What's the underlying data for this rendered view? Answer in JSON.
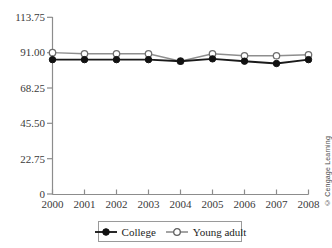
{
  "chart_data": {
    "type": "line",
    "title": "",
    "subtitle": "",
    "xlabel": "",
    "ylabel": "",
    "categories": [
      "2000",
      "2001",
      "2002",
      "2003",
      "2004",
      "2005",
      "2006",
      "2007",
      "2008"
    ],
    "x": [
      2000,
      2001,
      2002,
      2003,
      2004,
      2005,
      2006,
      2007,
      2008
    ],
    "series": [
      {
        "name": "College",
        "marker": "filled-circle",
        "color": "#111111",
        "values": [
          86.5,
          86.5,
          86.5,
          86.5,
          85.5,
          87.0,
          85.5,
          84.0,
          86.5
        ]
      },
      {
        "name": "Young adult",
        "marker": "open-circle",
        "color": "#6f6f6f",
        "values": [
          91.0,
          90.3,
          90.3,
          90.3,
          85.5,
          90.3,
          89.0,
          89.0,
          89.6
        ]
      }
    ],
    "ylim": [
      0,
      113.75
    ],
    "yticks": [
      0,
      22.75,
      45.5,
      68.25,
      91.0,
      113.75
    ],
    "ytick_labels": [
      "0",
      "22.75",
      "45.50",
      "68.25",
      "91.00",
      "113.75"
    ],
    "xlim": [
      2000,
      2008
    ],
    "grid": false,
    "legend_position": "bottom-center"
  },
  "legend": {
    "entries": [
      {
        "label": "College",
        "marker": "filled-circle"
      },
      {
        "label": "Young adult",
        "marker": "open-circle"
      }
    ]
  },
  "credit": {
    "text": "© Cengage Learning"
  },
  "colors": {
    "college": "#111111",
    "young_adult": "#6f6f6f",
    "axis": "#8c8c8c",
    "background": "#ffffff"
  }
}
